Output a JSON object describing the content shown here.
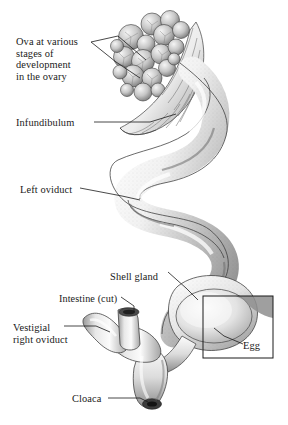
{
  "figure": {
    "style": "grayscale pen-and-ink stipple anatomical illustration",
    "background_color": "#ffffff",
    "ink_color": "#1a1a1a"
  },
  "labels": [
    {
      "id": "ova",
      "text": "Ova at various\nstages of\ndevelopment\nin the ovary",
      "lines": [
        "Ova at various",
        "stages of",
        "development",
        "in the ovary"
      ],
      "x": 16,
      "y": 36
    },
    {
      "id": "infundibulum",
      "text": "Infundibulum",
      "lines": [
        "Infundibulum"
      ],
      "x": 16,
      "y": 117
    },
    {
      "id": "left-oviduct",
      "text": "Left oviduct",
      "lines": [
        "Left oviduct"
      ],
      "x": 20,
      "y": 184
    },
    {
      "id": "shell-gland",
      "text": "Shell gland",
      "lines": [
        "Shell gland"
      ],
      "x": 110,
      "y": 271
    },
    {
      "id": "intestine-cut",
      "text": "Intestine (cut)",
      "lines": [
        "Intestine (cut)"
      ],
      "x": 59,
      "y": 293
    },
    {
      "id": "vestigial-right-oviduct",
      "text": "Vestigial\nright oviduct",
      "lines": [
        "Vestigial",
        "right oviduct"
      ],
      "x": 13,
      "y": 322
    },
    {
      "id": "egg",
      "text": "Egg",
      "lines": [
        "Egg"
      ],
      "x": 243,
      "y": 340
    },
    {
      "id": "cloaca",
      "text": "Cloaca",
      "lines": [
        "Cloaca"
      ],
      "x": 72,
      "y": 393
    }
  ],
  "inset_box": {
    "name": "egg-detail-box",
    "x": 203,
    "y": 296,
    "width": 70,
    "height": 62,
    "stroke": "#1a1a1a"
  },
  "structures": [
    {
      "id": "ovary-ova-cluster",
      "label": "Ova at various stages of development in the ovary"
    },
    {
      "id": "infundibulum-funnel",
      "label": "Infundibulum"
    },
    {
      "id": "oviduct-coil",
      "label": "Left oviduct"
    },
    {
      "id": "shell-gland-body",
      "label": "Shell gland"
    },
    {
      "id": "egg-in-shell-gland",
      "label": "Egg"
    },
    {
      "id": "intestine-stub",
      "label": "Intestine (cut)"
    },
    {
      "id": "vestigial-oviduct-stub",
      "label": "Vestigial right oviduct"
    },
    {
      "id": "cloaca-opening",
      "label": "Cloaca"
    }
  ]
}
